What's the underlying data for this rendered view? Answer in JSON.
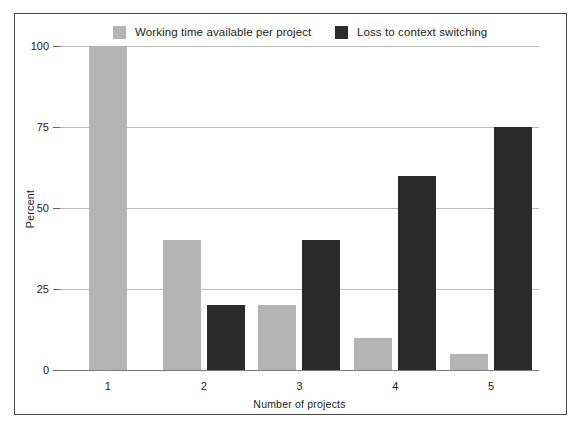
{
  "chart_data": {
    "type": "bar",
    "title": "",
    "subtitle": "",
    "xlabel": "Number of projects",
    "ylabel": "Percent",
    "categories": [
      "1",
      "2",
      "3",
      "4",
      "5"
    ],
    "series": [
      {
        "name": "Working time available per project",
        "color": "#b4b4b4",
        "values": [
          100,
          40,
          20,
          10,
          5
        ]
      },
      {
        "name": "Loss to context switching",
        "color": "#2b2b2b",
        "values": [
          0,
          20,
          40,
          60,
          75
        ]
      }
    ],
    "ylim": [
      0,
      100
    ],
    "yticks": [
      0,
      25,
      50,
      75,
      100
    ],
    "ytick_labels": [
      "0",
      "25",
      "50",
      "75",
      "100"
    ],
    "grid": true,
    "grid_axis": "y",
    "legend_position": "top",
    "annotations": []
  },
  "legend": {
    "entries": [
      {
        "label": "Working time available per project",
        "color": "#b4b4b4"
      },
      {
        "label": "Loss to context switching",
        "color": "#2b2b2b"
      }
    ]
  },
  "axes": {
    "y_title": "Percent",
    "x_title": "Number of projects",
    "y_tick_labels": [
      "100",
      "75",
      "50",
      "25",
      "0"
    ],
    "x_tick_labels": [
      "1",
      "2",
      "3",
      "4",
      "5"
    ]
  },
  "colors": {
    "series_a": "#b4b4b4",
    "series_b": "#2b2b2b",
    "gridline": "#b9b9b9",
    "frame": "#4a4a4a",
    "text": "#1c1c1c",
    "background": "#ffffff"
  }
}
